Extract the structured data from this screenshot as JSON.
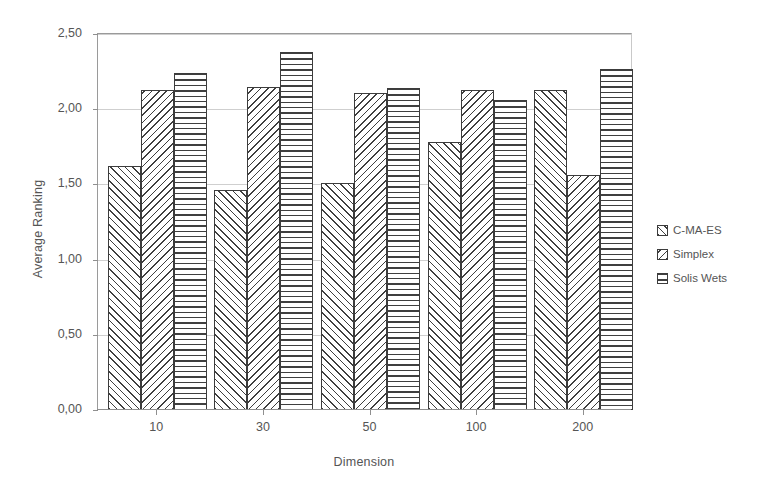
{
  "chart_data": {
    "type": "bar",
    "title": "",
    "xlabel": "Dimension",
    "ylabel": "Average Ranking",
    "categories": [
      "10",
      "30",
      "50",
      "100",
      "200"
    ],
    "series": [
      {
        "name": "C-MA-ES",
        "pattern": "forward-diagonal-hatch",
        "values": [
          1.62,
          1.46,
          1.51,
          1.78,
          2.13
        ]
      },
      {
        "name": "Simplex",
        "pattern": "backward-diagonal-hatch",
        "values": [
          2.13,
          2.15,
          2.11,
          2.13,
          1.56
        ]
      },
      {
        "name": "Solis Wets",
        "pattern": "horizontal-lines",
        "values": [
          2.24,
          2.38,
          2.14,
          2.06,
          2.27
        ]
      }
    ],
    "ylim": [
      0.0,
      2.5
    ],
    "y_ticks": [
      0.0,
      0.5,
      1.0,
      1.5,
      2.0,
      2.5
    ],
    "y_tick_labels": [
      "0,00",
      "0,50",
      "1,00",
      "1,50",
      "2,00",
      "2,50"
    ],
    "grid": true,
    "grid_axis": "y",
    "legend_position": "right",
    "decimal_separator": ",",
    "colors": {
      "bar_outline": "#3c3c3c",
      "bar_fill": "#ffffff",
      "hatch": "#3f3f3f",
      "gridline": "#cfcfcf",
      "axis": "#8f8f8f",
      "text": "#555555",
      "background": "#ffffff"
    }
  },
  "legend": {
    "entries": [
      {
        "label": "C-MA-ES"
      },
      {
        "label": "Simplex"
      },
      {
        "label": "Solis Wets"
      }
    ]
  }
}
